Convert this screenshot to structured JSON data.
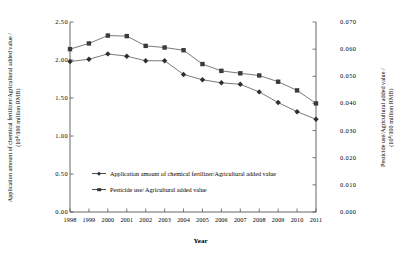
{
  "chart_data": {
    "type": "line",
    "title": "",
    "xlabel": "Year",
    "categories": [
      "1998",
      "1999",
      "2000",
      "2001",
      "2002",
      "2003",
      "2004",
      "2005",
      "2006",
      "2007",
      "2008",
      "2009",
      "2010",
      "2011"
    ],
    "grid": false,
    "legend_position": "inside-bottom-left",
    "axes": {
      "left": {
        "label_line1": "Application amount of chemical fertilizer/Agricultural added value /",
        "label_line2": "(10⁴/100 million RMB)",
        "ticks": [
          "0.00",
          "0.50",
          "1.00",
          "1.50",
          "2.00",
          "2.50"
        ],
        "tick_values": [
          0.0,
          0.5,
          1.0,
          1.5,
          2.0,
          2.5
        ],
        "ylim": [
          0.0,
          2.5
        ]
      },
      "right": {
        "label_line1": "Pesticide use/Agricultural added value /",
        "label_line2": "(10⁴/100 million RMB)",
        "ticks": [
          "0.000",
          "0.010",
          "0.020",
          "0.030",
          "0.040",
          "0.050",
          "0.060",
          "0.070"
        ],
        "tick_values": [
          0.0,
          0.01,
          0.02,
          0.03,
          0.04,
          0.05,
          0.06,
          0.07
        ],
        "ylim": [
          0.0,
          0.07
        ]
      }
    },
    "series": [
      {
        "name": "Application amount of chemical fertilizer/Agricultural added value",
        "marker": "diamond",
        "axis": "left",
        "color": "#333333",
        "values": [
          1.98,
          2.01,
          2.08,
          2.05,
          1.99,
          1.99,
          1.81,
          1.74,
          1.7,
          1.68,
          1.58,
          1.44,
          1.32,
          1.22
        ]
      },
      {
        "name": "Pesticide use/ Agricultural added value",
        "marker": "square",
        "axis": "right",
        "color": "#333333",
        "values": [
          0.06,
          0.0621,
          0.065,
          0.0648,
          0.0612,
          0.0606,
          0.0596,
          0.0545,
          0.052,
          0.0511,
          0.0503,
          0.048,
          0.0448,
          0.04
        ]
      }
    ]
  },
  "legend": {
    "items": [
      {
        "label": "Application amount of chemical fertilizer/Agricultural added value",
        "marker": "diamond"
      },
      {
        "label": "Pesticide use/ Agricultural added value",
        "marker": "square"
      }
    ]
  }
}
